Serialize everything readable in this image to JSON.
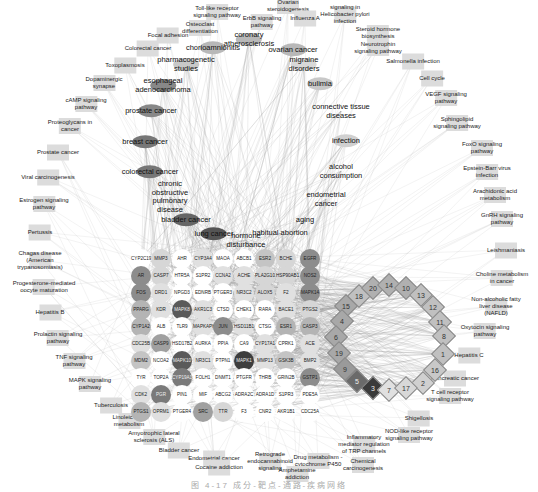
{
  "figure": {
    "caption": "图 4-17 成分-靶点-通路-疾病网络",
    "colors": {
      "edge": "#9a9a9a",
      "pathway_box": "#dcdcdc",
      "gene_dark": "#5a5a5a",
      "gene_mid": "#8c8c8c",
      "gene_light": "#c4c4c4",
      "gene_white": "#ffffff",
      "diamond_dark": "#3a3a3a",
      "diamond_mid": "#9a9a9a",
      "diamond_light": "#d0d0d0"
    }
  },
  "pathways": [
    {
      "label": "Toll-like receptor\nsignaling pathway",
      "x": 217,
      "y": 12
    },
    {
      "label": "ErbB signaling\npathway",
      "x": 262,
      "y": 22
    },
    {
      "label": "Ovarian\nsteroidogenesis",
      "x": 288,
      "y": 6
    },
    {
      "label": "Influenza A",
      "x": 305,
      "y": 18
    },
    {
      "label": "signaling in\nHelicobacter pylori\ninfection",
      "x": 345,
      "y": 14
    },
    {
      "label": "Steroid hormone\nbiosynthesis",
      "x": 378,
      "y": 33
    },
    {
      "label": "Neurotrophin\nsignaling pathway",
      "x": 378,
      "y": 48
    },
    {
      "label": "Osteoclast\ndifferentiation",
      "x": 200,
      "y": 28
    },
    {
      "label": "Focal adhesion",
      "x": 168,
      "y": 35
    },
    {
      "label": "Colorectal cancer",
      "x": 148,
      "y": 48
    },
    {
      "label": "Salmonella infection",
      "x": 413,
      "y": 61
    },
    {
      "label": "Toxoplasmosis",
      "x": 125,
      "y": 65
    },
    {
      "label": "Cell cycle",
      "x": 432,
      "y": 78
    },
    {
      "label": "Dopaminergic\nsynapse",
      "x": 104,
      "y": 83
    },
    {
      "label": "cAMP signaling\npathway",
      "x": 86,
      "y": 104
    },
    {
      "label": "VEGF signaling\npathway",
      "x": 446,
      "y": 98
    },
    {
      "label": "Proteoglycans in\ncancer",
      "x": 70,
      "y": 126
    },
    {
      "label": "Sphingolipid\nsignaling pathway",
      "x": 457,
      "y": 123
    },
    {
      "label": "Prostate cancer",
      "x": 58,
      "y": 152
    },
    {
      "label": "FoxO signaling\npathway",
      "x": 482,
      "y": 148
    },
    {
      "label": "Viral carcinogenesis",
      "x": 48,
      "y": 177
    },
    {
      "label": "Epstein-Barr virus\ninfection",
      "x": 487,
      "y": 172
    },
    {
      "label": "Arachidonic acid\nmetabolism",
      "x": 495,
      "y": 195
    },
    {
      "label": "Estrogen signaling\npathway",
      "x": 44,
      "y": 204
    },
    {
      "label": "GnRH signaling\npathway",
      "x": 502,
      "y": 219
    },
    {
      "label": "Pertussis",
      "x": 40,
      "y": 232
    },
    {
      "label": "Leishmaniasis",
      "x": 506,
      "y": 250
    },
    {
      "label": "Chagas disease\n(American\ntrypanosomiasis)",
      "x": 40,
      "y": 260
    },
    {
      "label": "Choline metabolism\nin cancer",
      "x": 502,
      "y": 278
    },
    {
      "label": "Progesterone-mediated\noocyte maturation",
      "x": 44,
      "y": 287
    },
    {
      "label": "Non-alcoholic fatty\nliver disease\n(NAFLD)",
      "x": 496,
      "y": 306
    },
    {
      "label": "Hepatitis B",
      "x": 50,
      "y": 312
    },
    {
      "label": "Oxytocin signaling\npathway",
      "x": 485,
      "y": 331
    },
    {
      "label": "Prolactin signaling\npathway",
      "x": 58,
      "y": 338
    },
    {
      "label": "Hepatitis C",
      "x": 469,
      "y": 355
    },
    {
      "label": "TNF signaling\npathway",
      "x": 74,
      "y": 361
    },
    {
      "label": "MAPK signaling\npathway",
      "x": 90,
      "y": 384
    },
    {
      "label": "Pancreatic cancer",
      "x": 455,
      "y": 378
    },
    {
      "label": "Tuberculosis",
      "x": 111,
      "y": 405
    },
    {
      "label": "T cell receptor\nsignaling pathway",
      "x": 450,
      "y": 396
    },
    {
      "label": "Linoleic acid\nmetabolism",
      "x": 129,
      "y": 421
    },
    {
      "label": "Shigellosis",
      "x": 419,
      "y": 418
    },
    {
      "label": "Amyotrophic lateral\nsclerosis (ALS)",
      "x": 154,
      "y": 437
    },
    {
      "label": "NOD-like receptor\nsignaling pathway",
      "x": 409,
      "y": 435
    },
    {
      "label": "Bladder cancer",
      "x": 179,
      "y": 450
    },
    {
      "label": "Inflammatory\nmediator regulation\nof TRP channels",
      "x": 364,
      "y": 444
    },
    {
      "label": "Endometrial cancer",
      "x": 214,
      "y": 458
    },
    {
      "label": "Retrograde\nendocannabinoid\nsignaling",
      "x": 270,
      "y": 461
    },
    {
      "label": "Drug metabolism -\ncytochrome P450",
      "x": 318,
      "y": 461
    },
    {
      "label": "Chemical\ncarcinogenesis",
      "x": 363,
      "y": 465
    },
    {
      "label": "Cocaine addiction",
      "x": 219,
      "y": 467
    },
    {
      "label": "Amphetamine\naddiction",
      "x": 297,
      "y": 474
    }
  ],
  "diseases": [
    {
      "label": "chorioamnionitis",
      "x": 213,
      "y": 48,
      "shade": "#b8b8b8"
    },
    {
      "label": "coronary\natherosclerosis",
      "x": 249,
      "y": 39,
      "shade": "#b8b8b8"
    },
    {
      "label": "ovarian cancer",
      "x": 293,
      "y": 50,
      "shade": "#b8b8b8"
    },
    {
      "label": "pharmacogenetic\nstudies",
      "x": 186,
      "y": 64,
      "shade": "#c8c8c8"
    },
    {
      "label": "migraine\ndisorders",
      "x": 304,
      "y": 64,
      "shade": "#d8d8d8"
    },
    {
      "label": "esophageal\nadenocarcinoma",
      "x": 163,
      "y": 85,
      "shade": "#888888"
    },
    {
      "label": "bulimia",
      "x": 320,
      "y": 84,
      "shade": "#c8c8c8"
    },
    {
      "label": "connective tissue\ndiseases",
      "x": 341,
      "y": 111,
      "shade": "#ffffff"
    },
    {
      "label": "prostate cancer",
      "x": 151,
      "y": 111,
      "shade": "#888888"
    },
    {
      "label": "breast cancer",
      "x": 145,
      "y": 142,
      "shade": "#777777"
    },
    {
      "label": "infection",
      "x": 346,
      "y": 141,
      "shade": "#d0d0d0"
    },
    {
      "label": "colorectal cancer",
      "x": 150,
      "y": 172,
      "shade": "#777777"
    },
    {
      "label": "alcohol\nconsumption",
      "x": 341,
      "y": 171,
      "shade": "#ffffff"
    },
    {
      "label": "chronic\nobstructive\npulmonary\ndisease",
      "x": 170,
      "y": 197,
      "shade": "#ffffff"
    },
    {
      "label": "endometrial\ncancer",
      "x": 326,
      "y": 199,
      "shade": "#ffffff"
    },
    {
      "label": "bladder cancer",
      "x": 186,
      "y": 220,
      "shade": "#666666"
    },
    {
      "label": "aging",
      "x": 305,
      "y": 220,
      "shade": "#ffffff"
    },
    {
      "label": "lung cancer",
      "x": 214,
      "y": 234,
      "shade": "#555555"
    },
    {
      "label": "hormone\ndisturbance",
      "x": 246,
      "y": 240,
      "shade": "#ffffff"
    },
    {
      "label": "habitual abortion",
      "x": 280,
      "y": 233,
      "shade": "#ffffff"
    }
  ],
  "genes": [
    {
      "label": "CYP2C19",
      "x": 141,
      "y": 259,
      "shade": "#ffffff"
    },
    {
      "label": "MMP3",
      "x": 161,
      "y": 259,
      "shade": "#d6d6d6"
    },
    {
      "label": "AHR",
      "x": 182,
      "y": 259,
      "shade": "#ffffff"
    },
    {
      "label": "CYP3A4",
      "x": 203,
      "y": 259,
      "shade": "#e0e0e0"
    },
    {
      "label": "MAOA",
      "x": 223,
      "y": 259,
      "shade": "#ffffff"
    },
    {
      "label": "ABCB1",
      "x": 244,
      "y": 259,
      "shade": "#ffffff"
    },
    {
      "label": "ESR2",
      "x": 265,
      "y": 259,
      "shade": "#c4c4c4"
    },
    {
      "label": "BCHE",
      "x": 286,
      "y": 259,
      "shade": "#d6d6d6"
    },
    {
      "label": "EGFR",
      "x": 310,
      "y": 259,
      "shade": "#8c8c8c"
    },
    {
      "label": "AR",
      "x": 141,
      "y": 276,
      "shade": "#8c8c8c"
    },
    {
      "label": "CASP7",
      "x": 161,
      "y": 276,
      "shade": "#d6d6d6"
    },
    {
      "label": "HTR5A",
      "x": 182,
      "y": 276,
      "shade": "#ffffff"
    },
    {
      "label": "S1PR2",
      "x": 203,
      "y": 276,
      "shade": "#ffffff"
    },
    {
      "label": "CCNA2",
      "x": 223,
      "y": 276,
      "shade": "#e0e0e0"
    },
    {
      "label": "ACHE",
      "x": 244,
      "y": 276,
      "shade": "#e0e0e0"
    },
    {
      "label": "PLA2G10",
      "x": 265,
      "y": 276,
      "shade": "#d6d6d6"
    },
    {
      "label": "HSP90AB1",
      "x": 286,
      "y": 276,
      "shade": "#d6d6d6"
    },
    {
      "label": "NOS2",
      "x": 310,
      "y": 276,
      "shade": "#8c8c8c"
    },
    {
      "label": "FOS",
      "x": 141,
      "y": 293,
      "shade": "#8c8c8c"
    },
    {
      "label": "DRD1",
      "x": 161,
      "y": 293,
      "shade": "#e0e0e0"
    },
    {
      "label": "NPGD3",
      "x": 182,
      "y": 293,
      "shade": "#ffffff"
    },
    {
      "label": "EDNRB",
      "x": 203,
      "y": 293,
      "shade": "#ffffff"
    },
    {
      "label": "PTGER3",
      "x": 223,
      "y": 293,
      "shade": "#ffffff"
    },
    {
      "label": "NR3C2",
      "x": 244,
      "y": 293,
      "shade": "#e0e0e0"
    },
    {
      "label": "ALOX5",
      "x": 265,
      "y": 293,
      "shade": "#d6d6d6"
    },
    {
      "label": "F2",
      "x": 286,
      "y": 293,
      "shade": "#e0e0e0"
    },
    {
      "label": "MAPK14",
      "x": 310,
      "y": 293,
      "shade": "#8c8c8c"
    },
    {
      "label": "PPARG",
      "x": 141,
      "y": 310,
      "shade": "#b4b4b4"
    },
    {
      "label": "KDR",
      "x": 161,
      "y": 310,
      "shade": "#e0e0e0"
    },
    {
      "label": "MAPK8",
      "x": 182,
      "y": 310,
      "shade": "#5a5a5a"
    },
    {
      "label": "AKR1C3",
      "x": 203,
      "y": 310,
      "shade": "#e0e0e0"
    },
    {
      "label": "CTSD",
      "x": 223,
      "y": 310,
      "shade": "#ffffff"
    },
    {
      "label": "CHEK1",
      "x": 244,
      "y": 310,
      "shade": "#ffffff"
    },
    {
      "label": "RARA",
      "x": 265,
      "y": 310,
      "shade": "#ffffff"
    },
    {
      "label": "BACE1",
      "x": 286,
      "y": 310,
      "shade": "#e0e0e0"
    },
    {
      "label": "PTGS2",
      "x": 310,
      "y": 310,
      "shade": "#d6d6d6"
    },
    {
      "label": "CYP1A2",
      "x": 141,
      "y": 327,
      "shade": "#b4b4b4"
    },
    {
      "label": "ALB",
      "x": 161,
      "y": 327,
      "shade": "#ffffff"
    },
    {
      "label": "TLR9",
      "x": 182,
      "y": 327,
      "shade": "#ffffff"
    },
    {
      "label": "MAPKAPK2",
      "x": 203,
      "y": 327,
      "shade": "#e0e0e0"
    },
    {
      "label": "JUN",
      "x": 223,
      "y": 327,
      "shade": "#8c8c8c"
    },
    {
      "label": "HSD11B1",
      "x": 244,
      "y": 327,
      "shade": "#e0e0e0"
    },
    {
      "label": "CTSG",
      "x": 265,
      "y": 327,
      "shade": "#ffffff"
    },
    {
      "label": "ESR1",
      "x": 286,
      "y": 327,
      "shade": "#b4b4b4"
    },
    {
      "label": "CASP3",
      "x": 310,
      "y": 327,
      "shade": "#b4b4b4"
    },
    {
      "label": "CDC25B",
      "x": 141,
      "y": 344,
      "shade": "#e0e0e0"
    },
    {
      "label": "CASP9",
      "x": 161,
      "y": 344,
      "shade": "#a0a0a0"
    },
    {
      "label": "HSD17B2",
      "x": 182,
      "y": 344,
      "shade": "#ffffff"
    },
    {
      "label": "AURKA",
      "x": 203,
      "y": 344,
      "shade": "#ffffff"
    },
    {
      "label": "PPIA",
      "x": 223,
      "y": 344,
      "shade": "#ffffff"
    },
    {
      "label": "CA9",
      "x": 244,
      "y": 344,
      "shade": "#ffffff"
    },
    {
      "label": "CYP17A1",
      "x": 265,
      "y": 344,
      "shade": "#e0e0e0"
    },
    {
      "label": "CPRK1",
      "x": 286,
      "y": 344,
      "shade": "#ffffff"
    },
    {
      "label": "ACE",
      "x": 310,
      "y": 344,
      "shade": "#e0e0e0"
    },
    {
      "label": "MDM2",
      "x": 141,
      "y": 361,
      "shade": "#c4c4c4"
    },
    {
      "label": "NCOA2",
      "x": 161,
      "y": 361,
      "shade": "#ffffff"
    },
    {
      "label": "MAPK10",
      "x": 182,
      "y": 361,
      "shade": "#5a5a5a"
    },
    {
      "label": "NR3C1",
      "x": 203,
      "y": 361,
      "shade": "#e0e0e0"
    },
    {
      "label": "PTPN1",
      "x": 223,
      "y": 361,
      "shade": "#ffffff"
    },
    {
      "label": "MAPK1",
      "x": 244,
      "y": 361,
      "shade": "#3e3e3e"
    },
    {
      "label": "MMP13",
      "x": 265,
      "y": 361,
      "shade": "#e0e0e0"
    },
    {
      "label": "GSK3B",
      "x": 286,
      "y": 361,
      "shade": "#c4c4c4"
    },
    {
      "label": "BMP2",
      "x": 310,
      "y": 361,
      "shade": "#e0e0e0"
    },
    {
      "label": "TYR",
      "x": 141,
      "y": 378,
      "shade": "#ffffff"
    },
    {
      "label": "TOP2A",
      "x": 161,
      "y": 378,
      "shade": "#ffffff"
    },
    {
      "label": "CYP19A1",
      "x": 182,
      "y": 378,
      "shade": "#7a7a7a"
    },
    {
      "label": "FOLH1",
      "x": 203,
      "y": 378,
      "shade": "#ffffff"
    },
    {
      "label": "DNMT1",
      "x": 223,
      "y": 378,
      "shade": "#ffffff"
    },
    {
      "label": "PTGFR",
      "x": 244,
      "y": 378,
      "shade": "#ffffff"
    },
    {
      "label": "THRB",
      "x": 265,
      "y": 378,
      "shade": "#ffffff"
    },
    {
      "label": "GRIN2B",
      "x": 286,
      "y": 378,
      "shade": "#ffffff"
    },
    {
      "label": "GSTP1",
      "x": 310,
      "y": 378,
      "shade": "#8c8c8c"
    },
    {
      "label": "CDK2",
      "x": 141,
      "y": 395,
      "shade": "#e0e0e0"
    },
    {
      "label": "PGR",
      "x": 161,
      "y": 395,
      "shade": "#7a7a7a"
    },
    {
      "label": "PIN1",
      "x": 182,
      "y": 395,
      "shade": "#ffffff"
    },
    {
      "label": "MIF",
      "x": 203,
      "y": 395,
      "shade": "#ffffff"
    },
    {
      "label": "ABCG2",
      "x": 223,
      "y": 395,
      "shade": "#ffffff"
    },
    {
      "label": "ADRA2C",
      "x": 244,
      "y": 395,
      "shade": "#ffffff"
    },
    {
      "label": "ADRA1D",
      "x": 265,
      "y": 395,
      "shade": "#ffffff"
    },
    {
      "label": "S1PR3",
      "x": 286,
      "y": 395,
      "shade": "#ffffff"
    },
    {
      "label": "PDE5A",
      "x": 310,
      "y": 395,
      "shade": "#ffffff"
    },
    {
      "label": "PTGS1",
      "x": 141,
      "y": 412,
      "shade": "#b4b4b4"
    },
    {
      "label": "OPRM1",
      "x": 161,
      "y": 412,
      "shade": "#e0e0e0"
    },
    {
      "label": "PTGER4",
      "x": 182,
      "y": 412,
      "shade": "#ffffff"
    },
    {
      "label": "SRC",
      "x": 203,
      "y": 412,
      "shade": "#a0a0a0"
    },
    {
      "label": "TTR",
      "x": 223,
      "y": 412,
      "shade": "#d6d6d6"
    },
    {
      "label": "F3",
      "x": 244,
      "y": 412,
      "shade": "#ffffff"
    },
    {
      "label": "CNR2",
      "x": 265,
      "y": 412,
      "shade": "#ffffff"
    },
    {
      "label": "AKR1B1",
      "x": 286,
      "y": 412,
      "shade": "#ffffff"
    },
    {
      "label": "CDC25A",
      "x": 310,
      "y": 412,
      "shade": "#ffffff"
    }
  ],
  "compounds": [
    {
      "label": "18",
      "x": 359,
      "y": 296,
      "shade": "#c0c0c0"
    },
    {
      "label": "20",
      "x": 373,
      "y": 288,
      "shade": "#b0b0b0"
    },
    {
      "label": "14",
      "x": 389,
      "y": 285,
      "shade": "#b0b0b0"
    },
    {
      "label": "10",
      "x": 406,
      "y": 288,
      "shade": "#b0b0b0"
    },
    {
      "label": "13",
      "x": 421,
      "y": 295,
      "shade": "#c0c0c0"
    },
    {
      "label": "12",
      "x": 433,
      "y": 307,
      "shade": "#c0c0c0"
    },
    {
      "label": "15",
      "x": 346,
      "y": 306,
      "shade": "#a8a8a8"
    },
    {
      "label": "11",
      "x": 440,
      "y": 322,
      "shade": "#c0c0c0"
    },
    {
      "label": "4",
      "x": 342,
      "y": 321,
      "shade": "#a8a8a8"
    },
    {
      "label": "8",
      "x": 444,
      "y": 336,
      "shade": "#c0c0c0"
    },
    {
      "label": "6",
      "x": 336,
      "y": 337,
      "shade": "#a8a8a8"
    },
    {
      "label": "1",
      "x": 443,
      "y": 354,
      "shade": "#c0c0c0"
    },
    {
      "label": "19",
      "x": 339,
      "y": 353,
      "shade": "#a8a8a8"
    },
    {
      "label": "16",
      "x": 435,
      "y": 370,
      "shade": "#c8c8c8"
    },
    {
      "label": "9",
      "x": 345,
      "y": 369,
      "shade": "#9a9a9a"
    },
    {
      "label": "2",
      "x": 423,
      "y": 383,
      "shade": "#d0d0d0"
    },
    {
      "label": "5",
      "x": 357,
      "y": 381,
      "shade": "#6a6a6a"
    },
    {
      "label": "3",
      "x": 373,
      "y": 388,
      "shade": "#3a3a3a"
    },
    {
      "label": "7",
      "x": 389,
      "y": 390,
      "shade": "#e0e0e0"
    },
    {
      "label": "17",
      "x": 406,
      "y": 388,
      "shade": "#d8d8d8"
    }
  ]
}
